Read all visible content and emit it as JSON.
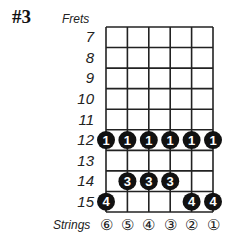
{
  "title": "#3",
  "frets_label": "Frets",
  "strings_label": "Strings",
  "frets": [
    "7",
    "8",
    "9",
    "10",
    "11",
    "12",
    "13",
    "14",
    "15"
  ],
  "strings": [
    "⑥",
    "⑤",
    "④",
    "③",
    "②",
    "①"
  ],
  "dots": [
    {
      "fret": 12,
      "string": 6,
      "finger": "1"
    },
    {
      "fret": 12,
      "string": 5,
      "finger": "1"
    },
    {
      "fret": 12,
      "string": 4,
      "finger": "1"
    },
    {
      "fret": 12,
      "string": 3,
      "finger": "1"
    },
    {
      "fret": 12,
      "string": 2,
      "finger": "1"
    },
    {
      "fret": 12,
      "string": 1,
      "finger": "1"
    },
    {
      "fret": 14,
      "string": 5,
      "finger": "3"
    },
    {
      "fret": 14,
      "string": 4,
      "finger": "3"
    },
    {
      "fret": 14,
      "string": 3,
      "finger": "3"
    },
    {
      "fret": 15,
      "string": 6,
      "finger": "4"
    },
    {
      "fret": 15,
      "string": 2,
      "finger": "4"
    },
    {
      "fret": 15,
      "string": 1,
      "finger": "4"
    }
  ],
  "colors": {
    "line": "#222222",
    "dot": "#111111",
    "dot_text": "#ffffff"
  }
}
